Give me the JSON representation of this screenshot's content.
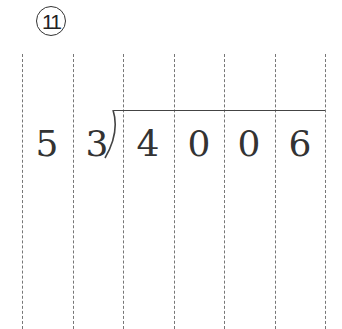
{
  "problem_number": "⑪",
  "problem_number_text": "11",
  "divisor": [
    "5",
    "3"
  ],
  "dividend": [
    "4",
    "0",
    "0",
    "6"
  ],
  "grid": {
    "column_lines_x": [
      22,
      73,
      123,
      174,
      224,
      275,
      325
    ],
    "line_style": "dashed"
  },
  "colors": {
    "text": "#333333",
    "grid": "#777777"
  }
}
